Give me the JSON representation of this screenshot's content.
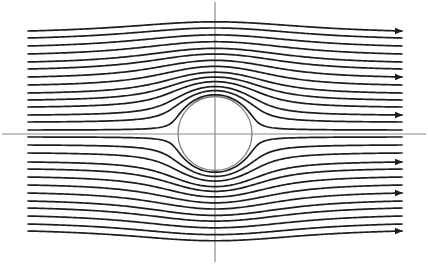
{
  "diagram": {
    "type": "streamline-plot",
    "canvas": {
      "width": 428,
      "height": 266,
      "background": "#ffffff"
    },
    "colors": {
      "streamline": "#1e1e1e",
      "axis": "#8a8a8a",
      "cylinder": "#808080"
    },
    "axes": {
      "horizontal": {
        "x1": 2,
        "x2": 426,
        "y": 134
      },
      "vertical": {
        "x": 215,
        "y1": 2,
        "y2": 262
      }
    },
    "cylinder": {
      "cx": 215,
      "cy": 133.5,
      "r": 37
    },
    "streamlines": {
      "x_start": 28,
      "x_end": 402,
      "flow_direction": "left-to-right",
      "upstream_y": [
        31,
        38,
        46,
        54,
        62,
        69,
        77,
        85,
        93,
        100,
        107,
        115,
        122,
        130,
        137,
        145,
        153,
        162,
        169,
        177,
        185,
        193,
        201,
        208,
        216,
        224,
        231
      ],
      "arrow_on_y": [
        31,
        77,
        115,
        162,
        193,
        231
      ]
    }
  }
}
